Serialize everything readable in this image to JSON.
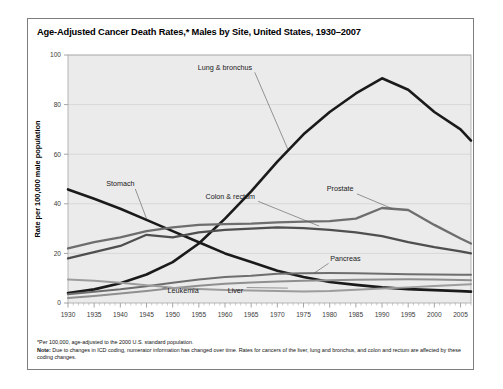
{
  "figure": {
    "title": "Age-Adjusted Cancer Death Rates,* Males by Site, United States, 1930–2007",
    "footnote_star": "*Per 100,000, age-adjusted to the 2000 U.S. standard population.",
    "footnote_note_label": "Note:",
    "footnote_note_text": " Due to changes in ICD coding, numerator information has changed over time. Rates for cancers of the liver, lung and bronchus, and colon and rectum are affected by these coding changes."
  },
  "chart_data": {
    "type": "line",
    "title": "Age-Adjusted Cancer Death Rates,* Males by Site, United States, 1930–2007",
    "xlabel": "",
    "ylabel": "Rate per 100,000 male population",
    "xlim": [
      1930,
      2007
    ],
    "ylim": [
      0,
      100
    ],
    "yticks": [
      0,
      20,
      40,
      60,
      80,
      100
    ],
    "xticks": [
      1930,
      1935,
      1940,
      1945,
      1950,
      1955,
      1960,
      1965,
      1970,
      1975,
      1980,
      1985,
      1990,
      1995,
      2000,
      2005
    ],
    "grid": "horizontal",
    "legend": "inline-labels",
    "x": [
      1930,
      1935,
      1940,
      1945,
      1950,
      1955,
      1960,
      1965,
      1970,
      1975,
      1980,
      1985,
      1990,
      1995,
      2000,
      2005,
      2007
    ],
    "series": [
      {
        "name": "Lung & bronchus",
        "color": "#1a1a1a",
        "width": 2.6,
        "label_x": 1960,
        "label_y": 94,
        "values": [
          4.0,
          5.5,
          8.0,
          11.5,
          16.5,
          24.0,
          34.0,
          45.0,
          57.0,
          68.0,
          77.0,
          84.5,
          90.6,
          86.0,
          77.0,
          70.0,
          65.5
        ]
      },
      {
        "name": "Stomach",
        "color": "#1a1a1a",
        "width": 2.6,
        "label_x": 1940,
        "label_y": 47,
        "values": [
          45.8,
          42.0,
          38.0,
          33.5,
          29.0,
          24.5,
          20.0,
          16.5,
          13.0,
          10.5,
          8.5,
          7.3,
          6.3,
          5.6,
          5.2,
          4.8,
          4.6
        ]
      },
      {
        "name": "Prostate",
        "color": "#6e6e6e",
        "width": 2.3,
        "label_x": 1982,
        "label_y": 45,
        "values": [
          22.0,
          24.5,
          26.5,
          29.0,
          30.5,
          31.5,
          31.8,
          32.0,
          32.5,
          32.8,
          33.0,
          34.0,
          38.3,
          37.5,
          31.5,
          26.0,
          24.0
        ]
      },
      {
        "name": "Colon & rectum",
        "color": "#4f4f4f",
        "width": 2.3,
        "label_x": 1961,
        "label_y": 42,
        "values": [
          18.0,
          20.5,
          23.0,
          27.5,
          26.5,
          28.5,
          29.5,
          30.0,
          30.5,
          30.2,
          29.5,
          28.5,
          27.0,
          24.5,
          22.5,
          20.8,
          20.0
        ]
      },
      {
        "name": "Pancreas",
        "color": "#6e6e6e",
        "width": 2.0,
        "label_x": 1983,
        "label_y": 17,
        "values": [
          3.5,
          4.5,
          5.5,
          6.8,
          8.2,
          9.5,
          10.5,
          11.0,
          11.8,
          12.0,
          12.1,
          12.0,
          11.8,
          11.6,
          11.5,
          11.4,
          11.4
        ]
      },
      {
        "name": "Leukemia",
        "color": "#8f8f8f",
        "width": 2.0,
        "label_x": 1952,
        "label_y": 4,
        "values": [
          2.0,
          2.8,
          3.8,
          4.8,
          6.0,
          7.0,
          7.8,
          8.3,
          8.7,
          9.0,
          9.2,
          9.4,
          9.5,
          9.6,
          9.5,
          9.3,
          9.2
        ]
      },
      {
        "name": "Liver",
        "color": "#9c9c9c",
        "width": 2.0,
        "label_x": 1962,
        "label_y": 4,
        "values": [
          9.5,
          9.0,
          8.2,
          7.2,
          6.2,
          5.6,
          5.2,
          5.0,
          4.8,
          4.6,
          4.8,
          5.3,
          5.8,
          6.3,
          6.9,
          7.4,
          7.6
        ]
      }
    ],
    "annotations": [
      {
        "text": "Lung & bronchus",
        "anchor_year": 1972,
        "anchor_value": 62
      },
      {
        "text": "Stomach",
        "anchor_year": 1945,
        "anchor_value": 34
      },
      {
        "text": "Prostate",
        "anchor_year": 1992,
        "anchor_value": 38
      },
      {
        "text": "Colon & rectum",
        "anchor_year": 1978,
        "anchor_value": 31
      },
      {
        "text": "Pancreas",
        "anchor_year": 1977,
        "anchor_value": 12
      },
      {
        "text": "Leukemia",
        "anchor_year": 1948,
        "anchor_value": 6
      },
      {
        "text": "Liver",
        "anchor_year": 1972,
        "anchor_value": 6
      }
    ]
  }
}
